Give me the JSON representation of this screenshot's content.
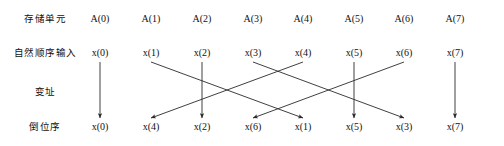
{
  "figure": {
    "title": "",
    "background_color": "#ffffff",
    "line_color": "#2a2a2a",
    "text_color": "#111111"
  },
  "row_labels": [
    {
      "key": "storage_unit",
      "text": "存储单元",
      "y": 18
    },
    {
      "key": "natural_order_input",
      "text": "自然顺序输入",
      "y": 52
    },
    {
      "key": "index_address",
      "text": "变址",
      "y": 91
    },
    {
      "key": "bit_reversed_order",
      "text": "倒位序",
      "y": 126
    }
  ],
  "columns_x": [
    100,
    151,
    202,
    253,
    303,
    354,
    404,
    455
  ],
  "rows": {
    "storage_unit": {
      "label": "存储单元",
      "y": 18,
      "cells": [
        "A(0)",
        "A(1)",
        "A(2)",
        "A(3)",
        "A(4)",
        "A(5)",
        "A(6)",
        "A(7)"
      ]
    },
    "natural_order_input": {
      "label": "自然顺序输入",
      "y": 52,
      "cells": [
        "x(0)",
        "x(1)",
        "x(2)",
        "x(3)",
        "x(4)",
        "x(5)",
        "x(6)",
        "x(7)"
      ]
    },
    "index_address": {
      "label": "变址",
      "y": 91,
      "cells": []
    },
    "bit_reversed_order": {
      "label": "倒位序",
      "y": 126,
      "cells": [
        "x(0)",
        "x(4)",
        "x(2)",
        "x(6)",
        "x(1)",
        "x(5)",
        "x(3)",
        "x(7)"
      ]
    }
  },
  "chart_data": {
    "type": "diagram",
    "top_row_label": "存储单元",
    "top_row_values": [
      "A(0)",
      "A(1)",
      "A(2)",
      "A(3)",
      "A(4)",
      "A(5)",
      "A(6)",
      "A(7)"
    ],
    "input_row_label": "自然顺序输入",
    "input_row_values": [
      "x(0)",
      "x(1)",
      "x(2)",
      "x(3)",
      "x(4)",
      "x(5)",
      "x(6)",
      "x(7)"
    ],
    "middle_row_label": "变址",
    "output_row_label": "倒位序",
    "output_row_values": [
      "x(0)",
      "x(4)",
      "x(2)",
      "x(6)",
      "x(1)",
      "x(5)",
      "x(3)",
      "x(7)"
    ],
    "mapping": [
      {
        "from_index": 0,
        "from": "x(0)",
        "to_index": 0,
        "to": "x(0)",
        "straight": true
      },
      {
        "from_index": 1,
        "from": "x(1)",
        "to_index": 4,
        "to": "x(1)",
        "straight": false
      },
      {
        "from_index": 2,
        "from": "x(2)",
        "to_index": 2,
        "to": "x(2)",
        "straight": true
      },
      {
        "from_index": 3,
        "from": "x(3)",
        "to_index": 6,
        "to": "x(3)",
        "straight": false
      },
      {
        "from_index": 4,
        "from": "x(4)",
        "to_index": 1,
        "to": "x(4)",
        "straight": false
      },
      {
        "from_index": 5,
        "from": "x(5)",
        "to_index": 5,
        "to": "x(5)",
        "straight": true
      },
      {
        "from_index": 6,
        "from": "x(6)",
        "to_index": 3,
        "to": "x(6)",
        "straight": false
      },
      {
        "from_index": 7,
        "from": "x(7)",
        "to_index": 7,
        "to": "x(7)",
        "straight": true
      }
    ],
    "arrow_start_y": 62,
    "arrow_end_y": 118
  }
}
